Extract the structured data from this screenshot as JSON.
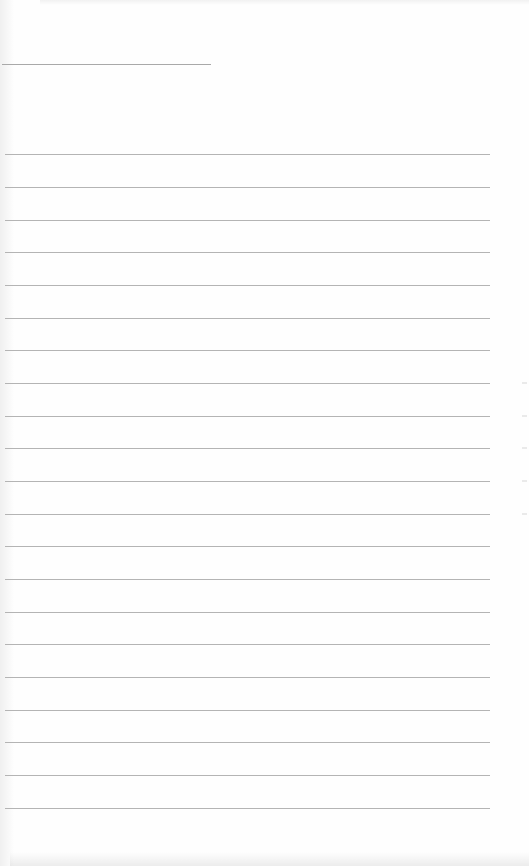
{
  "document": {
    "type": "blank lined sheet",
    "header_line": {
      "y": 64,
      "x1": 2,
      "x2": 211,
      "color": "#a9a9a9"
    },
    "ruled_lines": {
      "count": 21,
      "x1": 5,
      "x2": 490,
      "y_positions": [
        154,
        187,
        220,
        252,
        285,
        318,
        350,
        383,
        416,
        448,
        481,
        514,
        546,
        579,
        612,
        644,
        677,
        710,
        742,
        775,
        808
      ],
      "color": "#b4b4b4"
    },
    "text_content": ""
  }
}
